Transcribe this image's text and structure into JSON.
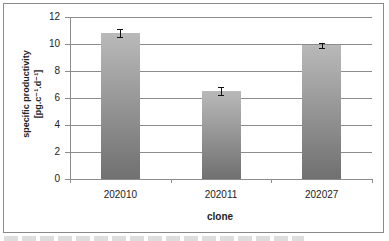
{
  "chart_data": {
    "type": "bar",
    "title": "",
    "xlabel": "clone",
    "ylabel": "specific productivity [pg.c⁻¹.d⁻¹]",
    "ylabel_line1": "specific productivity",
    "ylabel_line2": "[pg.c⁻¹.d⁻¹]",
    "categories": [
      "202010",
      "202011",
      "202027"
    ],
    "values": [
      10.8,
      6.5,
      9.9
    ],
    "error": [
      0.3,
      0.3,
      0.2
    ],
    "ylim": [
      0,
      12
    ],
    "yticks": [
      "0",
      "2",
      "4",
      "6",
      "8",
      "10",
      "12"
    ],
    "grid": true,
    "legend": null
  }
}
